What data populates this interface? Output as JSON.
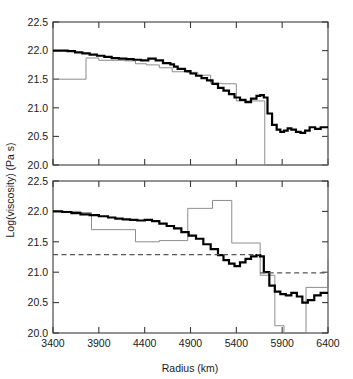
{
  "figure": {
    "xlabel": "Radius (km)",
    "ylabel": "Log(viscosity) (Pa s)",
    "xticks": [
      "3400",
      "3900",
      "4400",
      "4900",
      "5400",
      "5900",
      "6400"
    ],
    "yticks": [
      "20.0",
      "20.5",
      "21.0",
      "21.5",
      "22.0",
      "22.5"
    ],
    "colors": {
      "thick_curve": "#000000",
      "thin_curve": "#808080",
      "dashed_line": "#555555",
      "axis": "#3a3a3a",
      "background": "#ffffff"
    }
  },
  "chart_data": [
    {
      "type": "line",
      "panel": "top",
      "title": "",
      "xlabel": "",
      "ylabel": "Log(viscosity) (Pa s)",
      "xlim": [
        3400,
        6400
      ],
      "ylim": [
        20.0,
        22.5
      ],
      "xticks": [
        3400,
        3900,
        4400,
        4900,
        5400,
        5900,
        6400
      ],
      "yticks": [
        20.0,
        20.5,
        21.0,
        21.5,
        22.0,
        22.5
      ],
      "grid": false,
      "legend": null,
      "series": [
        {
          "name": "thick-step-curve",
          "style": "step-post",
          "linewidth": 2.2,
          "color": "#000000",
          "x": [
            3400,
            3480,
            3560,
            3640,
            3720,
            3800,
            3880,
            3960,
            4040,
            4120,
            4200,
            4280,
            4360,
            4440,
            4520,
            4600,
            4680,
            4720,
            4760,
            4840,
            4900,
            4960,
            5020,
            5080,
            5140,
            5200,
            5260,
            5320,
            5380,
            5440,
            5500,
            5560,
            5620,
            5660,
            5700,
            5740,
            5790,
            5840,
            5880,
            5920,
            5960,
            6000,
            6050,
            6100,
            6150,
            6200,
            6260,
            6320,
            6400
          ],
          "y": [
            22.0,
            22.0,
            21.99,
            21.97,
            21.95,
            21.93,
            21.91,
            21.89,
            21.87,
            21.86,
            21.85,
            21.84,
            21.83,
            21.86,
            21.83,
            21.78,
            21.76,
            21.72,
            21.68,
            21.64,
            21.6,
            21.56,
            21.52,
            21.48,
            21.42,
            21.35,
            21.3,
            21.24,
            21.18,
            21.14,
            21.1,
            21.16,
            21.21,
            21.22,
            21.18,
            20.9,
            20.7,
            20.62,
            20.58,
            20.6,
            20.64,
            20.62,
            20.58,
            20.56,
            20.6,
            20.66,
            20.63,
            20.66,
            20.66
          ]
        },
        {
          "name": "thin-step-curve",
          "style": "step-post",
          "linewidth": 0.9,
          "color": "#808080",
          "x": [
            3400,
            3760,
            3900,
            4180,
            4300,
            4420,
            4560,
            4700,
            4860,
            4980,
            5120,
            5240,
            5400,
            5700,
            5710,
            6400
          ],
          "y": [
            21.5,
            21.87,
            21.83,
            21.82,
            21.77,
            21.75,
            21.7,
            21.63,
            21.62,
            21.57,
            21.43,
            21.42,
            21.12,
            21.12,
            20.0,
            20.55
          ]
        }
      ]
    },
    {
      "type": "line",
      "panel": "bottom",
      "title": "",
      "xlabel": "Radius (km)",
      "ylabel": "Log(viscosity) (Pa s)",
      "xlim": [
        3400,
        6400
      ],
      "ylim": [
        20.0,
        22.5
      ],
      "xticks": [
        3400,
        3900,
        4400,
        4900,
        5400,
        5900,
        6400
      ],
      "yticks": [
        20.0,
        20.5,
        21.0,
        21.5,
        22.0,
        22.5
      ],
      "grid": false,
      "legend": null,
      "series": [
        {
          "name": "thick-step-curve",
          "style": "step-post",
          "linewidth": 2.2,
          "color": "#000000",
          "x": [
            3400,
            3500,
            3600,
            3700,
            3800,
            3900,
            4000,
            4080,
            4160,
            4240,
            4320,
            4400,
            4480,
            4560,
            4640,
            4720,
            4800,
            4880,
            4960,
            5040,
            5120,
            5200,
            5260,
            5320,
            5380,
            5440,
            5500,
            5560,
            5620,
            5660,
            5700,
            5760,
            5820,
            5880,
            5940,
            6000,
            6060,
            6120,
            6180,
            6250,
            6320,
            6400
          ],
          "y": [
            22.0,
            21.99,
            21.97,
            21.95,
            21.94,
            21.92,
            21.9,
            21.88,
            21.87,
            21.86,
            21.85,
            21.86,
            21.84,
            21.8,
            21.76,
            21.72,
            21.66,
            21.6,
            21.55,
            21.46,
            21.38,
            21.28,
            21.2,
            21.14,
            21.1,
            21.16,
            21.22,
            21.26,
            21.28,
            21.26,
            21.0,
            20.78,
            20.68,
            20.64,
            20.62,
            20.66,
            20.6,
            20.5,
            20.54,
            20.62,
            20.66,
            20.66
          ]
        },
        {
          "name": "thin-step-curve",
          "style": "step-post",
          "linewidth": 0.9,
          "color": "#808080",
          "x": [
            3400,
            3700,
            3820,
            4180,
            4300,
            4540,
            4560,
            4850,
            4870,
            5120,
            5140,
            5330,
            5350,
            5640,
            5660,
            5800,
            5820,
            5900,
            5920,
            6140,
            6160,
            6280,
            6400
          ],
          "y": [
            22.0,
            21.98,
            21.7,
            21.7,
            21.5,
            21.5,
            21.52,
            21.52,
            22.05,
            22.05,
            22.18,
            22.18,
            21.48,
            21.48,
            20.95,
            20.95,
            20.12,
            20.12,
            20.0,
            20.0,
            20.75,
            20.75,
            21.21
          ]
        }
      ],
      "annotations": [
        {
          "name": "upper-dashed-reference",
          "type": "dashed-segment",
          "y": 21.29,
          "x_start": 3400,
          "x_end": 5660,
          "color": "#555555"
        },
        {
          "name": "lower-dashed-reference",
          "type": "dashed-segment",
          "y": 20.99,
          "x_start": 5660,
          "x_end": 6400,
          "color": "#555555"
        }
      ]
    }
  ]
}
